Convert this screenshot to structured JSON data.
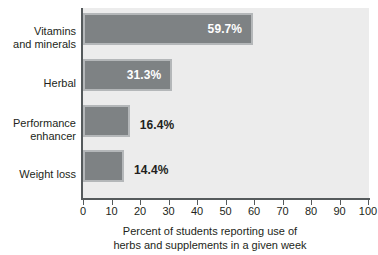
{
  "chart_data": {
    "type": "bar",
    "orientation": "horizontal",
    "title": "",
    "categories": [
      "Vitamins and minerals",
      "Herbal",
      "Performance enhancer",
      "Weight loss"
    ],
    "category_lines": [
      [
        "Vitamins",
        "and minerals"
      ],
      [
        "Herbal"
      ],
      [
        "Performance",
        "enhancer"
      ],
      [
        "Weight loss"
      ]
    ],
    "values": [
      59.7,
      31.3,
      16.4,
      14.4
    ],
    "data_labels": [
      "59.7%",
      "31.3%",
      "16.4%",
      "14.4%"
    ],
    "label_placement": [
      "inside",
      "inside",
      "outside",
      "outside"
    ],
    "xlabel": "Percent of students reporting use of herbs and supplements in a given week",
    "xlabel_lines": [
      "Percent of students reporting use of",
      "herbs and supplements in a given week"
    ],
    "ylabel": "",
    "xlim": [
      0,
      100
    ],
    "xticks": [
      0,
      10,
      20,
      30,
      40,
      50,
      60,
      70,
      80,
      90,
      100
    ],
    "xtick_labels": [
      "0",
      "10",
      "20",
      "30",
      "40",
      "50",
      "60",
      "70",
      "80",
      "90",
      "100"
    ],
    "grid": false,
    "legend": null,
    "colors": {
      "bar_fill": "#7e8284",
      "bar_border": "#b4b7b9",
      "plot_background": "#ececec",
      "page_background": "#ffffff",
      "axis_line": "#555a5c",
      "text": "#231f20",
      "inside_label_text": "#ffffff"
    }
  }
}
